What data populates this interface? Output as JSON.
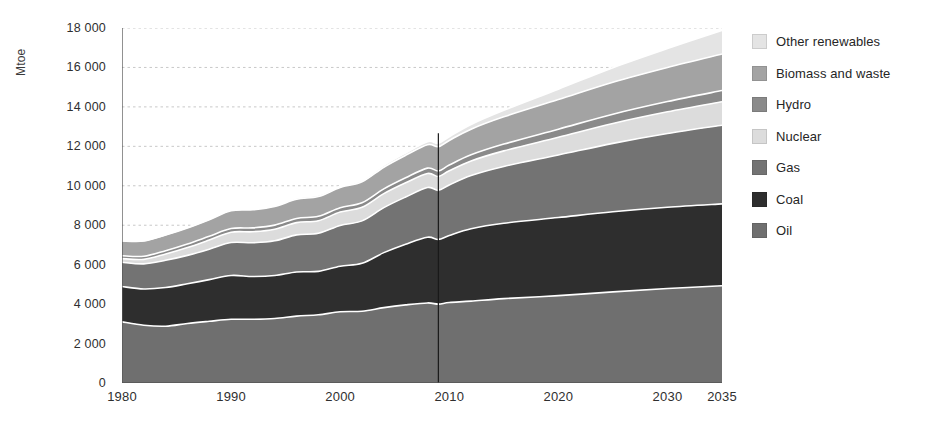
{
  "chart_data": {
    "type": "area",
    "stacked": true,
    "title": "",
    "xlabel": "",
    "ylabel": "Mtoe",
    "ylim": [
      0,
      18000
    ],
    "xlim": [
      1980,
      2035
    ],
    "ytick_labels": [
      "0",
      "2 000",
      "4 000",
      "6 000",
      "8 000",
      "10 000",
      "12 000",
      "14 000",
      "16 000",
      "18 000"
    ],
    "ytick_values": [
      0,
      2000,
      4000,
      6000,
      8000,
      10000,
      12000,
      14000,
      16000,
      18000
    ],
    "xtick_labels": [
      "1980",
      "1990",
      "2000",
      "2010",
      "2020",
      "2030",
      "2035"
    ],
    "xtick_values": [
      1980,
      1990,
      2000,
      2010,
      2020,
      2030,
      2035
    ],
    "x_minor_ticks": [
      1980,
      1985,
      1990,
      1995,
      2000,
      2005,
      2010,
      2015,
      2020,
      2025,
      2030,
      2035
    ],
    "grid": "horizontal-dotted",
    "legend_position": "right",
    "divider_year": 2009,
    "x": [
      1980,
      1982,
      1984,
      1986,
      1988,
      1990,
      1992,
      1994,
      1996,
      1998,
      2000,
      2002,
      2004,
      2006,
      2008,
      2009,
      2010,
      2012,
      2015,
      2020,
      2025,
      2030,
      2035
    ],
    "series": [
      {
        "name": "Oil",
        "color": "#6f6f6f",
        "values": [
          3100,
          2930,
          2880,
          3020,
          3130,
          3230,
          3230,
          3270,
          3390,
          3460,
          3610,
          3640,
          3820,
          3960,
          4060,
          4000,
          4080,
          4150,
          4280,
          4430,
          4620,
          4790,
          4930
        ]
      },
      {
        "name": "Coal",
        "color": "#2e2e2e",
        "values": [
          1790,
          1840,
          1960,
          2010,
          2110,
          2220,
          2170,
          2180,
          2240,
          2200,
          2310,
          2430,
          2790,
          3080,
          3330,
          3280,
          3400,
          3670,
          3820,
          3960,
          4060,
          4120,
          4150
        ]
      },
      {
        "name": "Gas",
        "color": "#737373",
        "values": [
          1230,
          1270,
          1380,
          1440,
          1540,
          1670,
          1710,
          1760,
          1880,
          1930,
          2070,
          2150,
          2280,
          2390,
          2520,
          2490,
          2560,
          2700,
          2880,
          3170,
          3470,
          3740,
          3990
        ]
      },
      {
        "name": "Nuclear",
        "color": "#dcdcdc",
        "values": [
          186,
          230,
          320,
          400,
          470,
          526,
          560,
          590,
          620,
          640,
          676,
          690,
          710,
          720,
          712,
          703,
          719,
          740,
          790,
          900,
          1010,
          1100,
          1190
        ]
      },
      {
        "name": "Hydro",
        "color": "#8a8a8a",
        "values": [
          148,
          158,
          170,
          180,
          190,
          184,
          195,
          205,
          215,
          225,
          225,
          230,
          242,
          255,
          272,
          280,
          290,
          310,
          345,
          410,
          470,
          520,
          570
        ]
      },
      {
        "name": "Biomass and waste",
        "color": "#a3a3a3",
        "values": [
          749,
          770,
          790,
          810,
          840,
          903,
          920,
          940,
          970,
          1000,
          1023,
          1060,
          1100,
          1140,
          1190,
          1230,
          1250,
          1300,
          1380,
          1500,
          1620,
          1730,
          1850
        ]
      },
      {
        "name": "Other renewables",
        "color": "#e4e4e4",
        "values": [
          12,
          14,
          17,
          21,
          26,
          36,
          44,
          52,
          62,
          75,
          60,
          75,
          95,
          120,
          155,
          174,
          190,
          240,
          330,
          530,
          740,
          960,
          1200
        ]
      }
    ]
  },
  "legend": {
    "items": [
      {
        "label": "Other renewables",
        "color": "#e4e4e4"
      },
      {
        "label": "Biomass and waste",
        "color": "#a3a3a3"
      },
      {
        "label": "Hydro",
        "color": "#8a8a8a"
      },
      {
        "label": "Nuclear",
        "color": "#dcdcdc"
      },
      {
        "label": "Gas",
        "color": "#737373"
      },
      {
        "label": "Coal",
        "color": "#2e2e2e"
      },
      {
        "label": "Oil",
        "color": "#6f6f6f"
      }
    ]
  },
  "axis": {
    "unit_label": "Mtoe",
    "axis_color": "#555555",
    "grid_color": "#c8c8c8",
    "divider_color": "#1a1a1a",
    "separator_color": "#ffffff"
  }
}
